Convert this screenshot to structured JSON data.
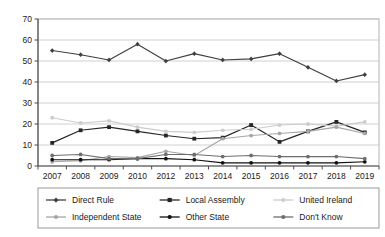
{
  "chart_data": {
    "type": "line",
    "title": "",
    "xlabel": "",
    "ylabel": "",
    "ylim": [
      0,
      70
    ],
    "ytick_step": 10,
    "yticks": [
      "0",
      "10",
      "20",
      "30",
      "40",
      "50",
      "60",
      "70"
    ],
    "grid": true,
    "grid_axis": "y",
    "legend_position": "bottom",
    "legend_columns": 3,
    "categories": [
      "2007",
      "2008",
      "2009",
      "2010",
      "2012",
      "2013",
      "2014",
      "2015",
      "2016",
      "2017",
      "2018",
      "2019"
    ],
    "series": [
      {
        "name": "Direct Rule",
        "color": "#3f3f3f",
        "marker": "diamond",
        "values": [
          55,
          53,
          50.5,
          58,
          50,
          53.5,
          50.5,
          51,
          53.5,
          47,
          40.5,
          43.5
        ]
      },
      {
        "name": "Local Assembly",
        "color": "#262626",
        "marker": "square",
        "values": [
          11,
          17,
          18.5,
          16.5,
          14.5,
          13,
          13.5,
          19.5,
          11.5,
          16.5,
          21,
          16
        ]
      },
      {
        "name": "United Ireland",
        "color": "#cccccc",
        "marker": "circle",
        "values": [
          23,
          20.5,
          21.5,
          18.5,
          16.5,
          16,
          17,
          17.5,
          19.5,
          20,
          19,
          21
        ]
      },
      {
        "name": "Independent State",
        "color": "#a6a6a6",
        "marker": "circle",
        "values": [
          2,
          2.5,
          4.5,
          4,
          7,
          5,
          13,
          14.5,
          15.5,
          16.5,
          18.5,
          15.5
        ]
      },
      {
        "name": "Other State",
        "color": "#111111",
        "marker": "circle",
        "values": [
          3,
          3,
          3,
          3.5,
          3.5,
          3,
          1.5,
          1.5,
          1.5,
          1.5,
          1.5,
          2
        ]
      },
      {
        "name": "Don't Know",
        "color": "#6e6e6e",
        "marker": "circle",
        "values": [
          5,
          5.5,
          3.5,
          3.5,
          5.5,
          5.5,
          4.5,
          5,
          4.5,
          4.5,
          4.5,
          3.5
        ]
      }
    ]
  },
  "legend": {
    "items": [
      {
        "label": "Direct Rule"
      },
      {
        "label": "Local Assembly"
      },
      {
        "label": "United Ireland"
      },
      {
        "label": "Independent State"
      },
      {
        "label": "Other State"
      },
      {
        "label": "Don't Know"
      }
    ]
  }
}
